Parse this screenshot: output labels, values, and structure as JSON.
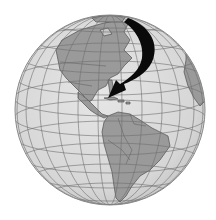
{
  "image": {
    "description": "Grayscale orthographic globe centered on the Americas with a black curved arrow pointing from the North Atlantic down to the Caribbean",
    "subject_region": "Caribbean",
    "arrow_direction": "curving down-left from north Atlantic to Caribbean"
  },
  "colors": {
    "background": "#ffffff",
    "ocean": "#dcdcdc",
    "land": "#9a9a9a",
    "gridlines": "#6e6e6e",
    "coastlines": "#505050",
    "arrow": "#0a0a0a",
    "globe_edge": "#8a8a8a"
  },
  "globe": {
    "center_x": 110,
    "center_y": 110,
    "radius": 95
  }
}
